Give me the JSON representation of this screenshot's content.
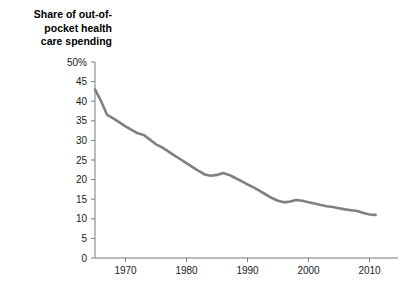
{
  "chart_data": {
    "type": "line",
    "title": "Share of out-of-\npocket health\ncare spending",
    "xlabel": "",
    "ylabel": "",
    "xlim": [
      1965,
      2012
    ],
    "ylim": [
      0,
      50
    ],
    "grid": false,
    "legend": null,
    "line_color": "#808080",
    "axis_color": "#7a7a7a",
    "y_ticks": [
      {
        "value": 50,
        "label": "50%"
      },
      {
        "value": 45,
        "label": "45"
      },
      {
        "value": 40,
        "label": "40"
      },
      {
        "value": 35,
        "label": "35"
      },
      {
        "value": 30,
        "label": "30"
      },
      {
        "value": 25,
        "label": "25"
      },
      {
        "value": 20,
        "label": "20"
      },
      {
        "value": 15,
        "label": "15"
      },
      {
        "value": 10,
        "label": "10"
      },
      {
        "value": 5,
        "label": "5"
      },
      {
        "value": 0,
        "label": "0"
      }
    ],
    "x_ticks": [
      {
        "value": 1970,
        "label": "1970"
      },
      {
        "value": 1980,
        "label": "1980"
      },
      {
        "value": 1990,
        "label": "1990"
      },
      {
        "value": 2000,
        "label": "2000"
      },
      {
        "value": 2010,
        "label": "2010"
      }
    ],
    "series": [
      {
        "name": "Share of out-of-pocket health care spending",
        "x": [
          1965,
          1966,
          1967,
          1968,
          1969,
          1970,
          1971,
          1972,
          1973,
          1974,
          1975,
          1976,
          1977,
          1978,
          1979,
          1980,
          1981,
          1982,
          1983,
          1984,
          1985,
          1986,
          1987,
          1988,
          1989,
          1990,
          1991,
          1992,
          1993,
          1994,
          1995,
          1996,
          1997,
          1998,
          1999,
          2000,
          2001,
          2002,
          2003,
          2004,
          2005,
          2006,
          2007,
          2008,
          2009,
          2010,
          2011
        ],
        "values": [
          43.0,
          40.0,
          36.5,
          35.6,
          34.6,
          33.6,
          32.7,
          31.8,
          31.4,
          30.2,
          29.0,
          28.2,
          27.2,
          26.2,
          25.2,
          24.2,
          23.2,
          22.2,
          21.3,
          21.0,
          21.2,
          21.7,
          21.2,
          20.4,
          19.6,
          18.8,
          18.0,
          17.1,
          16.2,
          15.3,
          14.6,
          14.2,
          14.4,
          14.8,
          14.6,
          14.2,
          13.9,
          13.5,
          13.2,
          13.0,
          12.7,
          12.4,
          12.2,
          12.0,
          11.5,
          11.1,
          11.0
        ]
      }
    ]
  }
}
